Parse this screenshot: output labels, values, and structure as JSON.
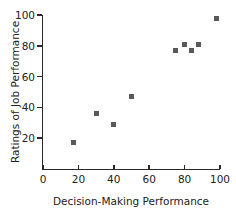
{
  "chart_data": {
    "type": "scatter",
    "title": "",
    "xlabel": "Decision-Making Performance",
    "ylabel": "Ratings of Job Performance",
    "points": [
      [
        17,
        17
      ],
      [
        30,
        36
      ],
      [
        40,
        29
      ],
      [
        50,
        47
      ],
      [
        75,
        77
      ],
      [
        80,
        81
      ],
      [
        84,
        77
      ],
      [
        88,
        81
      ],
      [
        98,
        98
      ]
    ],
    "xlim": [
      0,
      100
    ],
    "ylim": [
      0,
      100
    ],
    "x_ticks": [
      0,
      20,
      40,
      60,
      80,
      100
    ],
    "y_ticks": [
      20,
      40,
      60,
      80,
      100
    ],
    "grid": false,
    "legend": "none",
    "marker": {
      "shape": "square",
      "color": "#595959",
      "size_px": 5
    },
    "axis_color": "#2a2a2a",
    "text_color": "#222222",
    "background": "#ffffff"
  }
}
